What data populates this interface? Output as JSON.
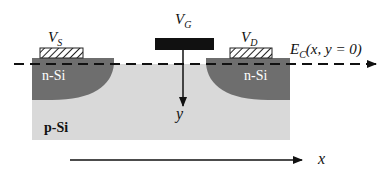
{
  "diagram": {
    "labels": {
      "source_voltage": {
        "main": "V",
        "sub": "S"
      },
      "gate_voltage": {
        "main": "V",
        "sub": "G"
      },
      "drain_voltage": {
        "main": "V",
        "sub": "D"
      },
      "band_edge": {
        "main": "E",
        "sub": "C",
        "args": "(x, y = 0)"
      },
      "source_region": "n-Si",
      "drain_region": "n-Si",
      "substrate": "p-Si",
      "y_axis": "y",
      "x_axis": "x"
    },
    "colors": {
      "substrate": "#d9d9d9",
      "n_region": "#6e6e6e",
      "gate": "#111111",
      "contact_hatch": "#222222",
      "line": "#111111",
      "region_text": "#ffffff",
      "substrate_text": "#111111"
    }
  }
}
